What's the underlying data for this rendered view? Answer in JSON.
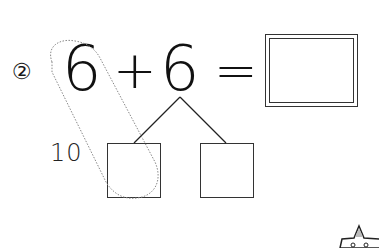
{
  "worksheet": {
    "problem_number": "②",
    "equation": {
      "addend_1": "6",
      "operator": "+",
      "addend_2": "6",
      "equals": "=",
      "answer": ""
    },
    "decomposition": {
      "grouping_label": "10",
      "left_part": "",
      "right_part": ""
    },
    "icons": {
      "corner_badge": "star-icon"
    },
    "colors": {
      "ink": "#1a1a1a",
      "dashed_outline": "#888888",
      "star_fill": "#bbbbbb"
    }
  }
}
